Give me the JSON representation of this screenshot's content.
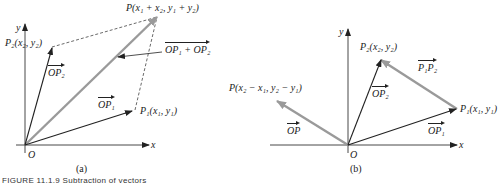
{
  "figure": {
    "caption": "FIGURE 11.1.9   Subtraction of vectors",
    "colors": {
      "black_vector": "#222222",
      "gray_vector": "#9a9a9a",
      "axis": "#333333"
    }
  },
  "panel_a": {
    "tag": "(a)",
    "axis_x": "x",
    "axis_y": "y",
    "origin": "O",
    "labels": {
      "P": "P(x₁ + x₂, y₁ + y₂)",
      "P1": "P₁(x₁, y₁)",
      "P2": "P₂(x₂, y₂)",
      "OP1": "OP₁",
      "OP2": "OP₂",
      "sum": "OP₁ + OP₂"
    }
  },
  "panel_b": {
    "tag": "(b)",
    "axis_x": "x",
    "axis_y": "y",
    "origin": "O",
    "labels": {
      "P": "P(x₂ − x₁, y₂ − y₁)",
      "P1": "P₁(x₁, y₁)",
      "P2": "P₂(x₂, y₂)",
      "OP": "OP",
      "OP1": "OP₁",
      "OP2": "OP₂",
      "P1P2": "P₁P₂"
    }
  }
}
